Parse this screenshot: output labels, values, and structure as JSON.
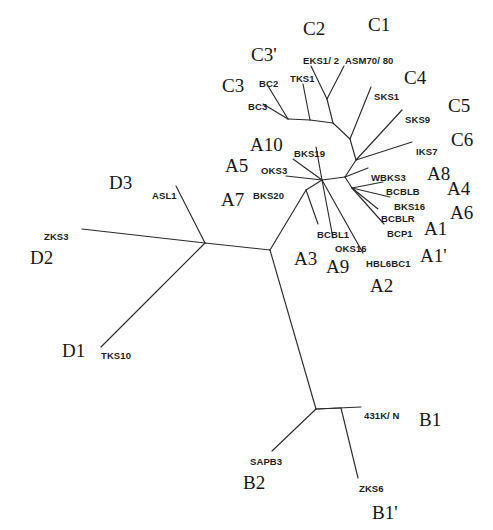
{
  "figure": {
    "kind": "unrooted-phylogenetic-tree",
    "background_color": "#ffffff",
    "line_color": "#2b2b2b",
    "text_color": "#1d1d1d",
    "width": 493,
    "height": 530
  },
  "chart_data": {
    "type": "tree",
    "title": "",
    "leaves": [
      "BC2",
      "BC3",
      "TKS1",
      "EKS1/ 2",
      "ASM70/ 80",
      "SKS1",
      "SKS9",
      "IKS7",
      "BKS19",
      "OKS3",
      "BKS20",
      "WBKS3",
      "BCBLB",
      "BKS16",
      "BCBLR",
      "BCP1",
      "BCBL1",
      "OKS16",
      "HBL6BC1",
      "ASL1",
      "ZKS3",
      "TKS10",
      "431K/ N",
      "SAPB3",
      "ZKS6"
    ],
    "clades": [
      "C1",
      "C2",
      "C3",
      "C3'",
      "C4",
      "C5",
      "C6",
      "A1",
      "A1'",
      "A2",
      "A3",
      "A4",
      "A5",
      "A6",
      "A7",
      "A8",
      "A9",
      "A10",
      "B1",
      "B1'",
      "B2",
      "D1",
      "D2",
      "D3"
    ]
  },
  "leaf_labels": [
    {
      "name": "leaf-bc2",
      "text": "BC2",
      "x": 259,
      "y": 78
    },
    {
      "name": "leaf-bc3",
      "text": "BC3",
      "x": 248,
      "y": 101
    },
    {
      "name": "leaf-tks1",
      "text": "TKS1",
      "x": 290,
      "y": 73
    },
    {
      "name": "leaf-eks12",
      "text": "EKS1/ 2",
      "x": 303,
      "y": 55
    },
    {
      "name": "leaf-asm7080",
      "text": "ASM70/ 80",
      "x": 345,
      "y": 55
    },
    {
      "name": "leaf-sks1",
      "text": "SKS1",
      "x": 374,
      "y": 91
    },
    {
      "name": "leaf-sks9",
      "text": "SKS9",
      "x": 405,
      "y": 114
    },
    {
      "name": "leaf-iks7",
      "text": "IKS7",
      "x": 416,
      "y": 146
    },
    {
      "name": "leaf-bks19",
      "text": "BKS19",
      "x": 294,
      "y": 148
    },
    {
      "name": "leaf-oks3",
      "text": "OKS3",
      "x": 261,
      "y": 165
    },
    {
      "name": "leaf-bks20",
      "text": "BKS20",
      "x": 253,
      "y": 190
    },
    {
      "name": "leaf-wbks3",
      "text": "WBKS3",
      "x": 371,
      "y": 172
    },
    {
      "name": "leaf-bcblb",
      "text": "BCBLB",
      "x": 386,
      "y": 186
    },
    {
      "name": "leaf-bks16",
      "text": "BKS16",
      "x": 394,
      "y": 201
    },
    {
      "name": "leaf-bcblr",
      "text": "BCBLR",
      "x": 381,
      "y": 213
    },
    {
      "name": "leaf-bcp1",
      "text": "BCP1",
      "x": 387,
      "y": 228
    },
    {
      "name": "leaf-bcbl1",
      "text": "BCBL1",
      "x": 317,
      "y": 229
    },
    {
      "name": "leaf-oks16",
      "text": "OKS16",
      "x": 335,
      "y": 243
    },
    {
      "name": "leaf-hbl6bc1",
      "text": "HBL6BC1",
      "x": 366,
      "y": 258
    },
    {
      "name": "leaf-asl1",
      "text": "ASL1",
      "x": 152,
      "y": 190
    },
    {
      "name": "leaf-zks3",
      "text": "ZKS3",
      "x": 44,
      "y": 231
    },
    {
      "name": "leaf-tks10",
      "text": "TKS10",
      "x": 101,
      "y": 350
    },
    {
      "name": "leaf-431kn",
      "text": "431K/ N",
      "x": 364,
      "y": 410
    },
    {
      "name": "leaf-sapb3",
      "text": "SAPB3",
      "x": 250,
      "y": 456
    },
    {
      "name": "leaf-zks6",
      "text": "ZKS6",
      "x": 359,
      "y": 483
    }
  ],
  "group_labels": [
    {
      "name": "clade-c2",
      "text": "C2",
      "x": 303,
      "y": 18
    },
    {
      "name": "clade-c1",
      "text": "C1",
      "x": 368,
      "y": 14
    },
    {
      "name": "clade-c3p",
      "text": "C3'",
      "x": 251,
      "y": 44
    },
    {
      "name": "clade-c3",
      "text": "C3",
      "x": 222,
      "y": 75
    },
    {
      "name": "clade-c4",
      "text": "C4",
      "x": 404,
      "y": 67
    },
    {
      "name": "clade-c5",
      "text": "C5",
      "x": 448,
      "y": 95
    },
    {
      "name": "clade-c6",
      "text": "C6",
      "x": 451,
      "y": 129
    },
    {
      "name": "clade-a10",
      "text": "A10",
      "x": 250,
      "y": 134
    },
    {
      "name": "clade-a5",
      "text": "A5",
      "x": 225,
      "y": 155
    },
    {
      "name": "clade-a7",
      "text": "A7",
      "x": 221,
      "y": 189
    },
    {
      "name": "clade-a8",
      "text": "A8",
      "x": 427,
      "y": 163
    },
    {
      "name": "clade-a4",
      "text": "A4",
      "x": 447,
      "y": 178
    },
    {
      "name": "clade-a6",
      "text": "A6",
      "x": 450,
      "y": 202
    },
    {
      "name": "clade-a1",
      "text": "A1",
      "x": 424,
      "y": 218
    },
    {
      "name": "clade-a1p",
      "text": "A1'",
      "x": 420,
      "y": 245
    },
    {
      "name": "clade-a3",
      "text": "A3",
      "x": 294,
      "y": 248
    },
    {
      "name": "clade-a9",
      "text": "A9",
      "x": 326,
      "y": 256
    },
    {
      "name": "clade-a2",
      "text": "A2",
      "x": 370,
      "y": 275
    },
    {
      "name": "clade-d3",
      "text": "D3",
      "x": 109,
      "y": 172
    },
    {
      "name": "clade-d2",
      "text": "D2",
      "x": 30,
      "y": 247
    },
    {
      "name": "clade-d1",
      "text": "D1",
      "x": 62,
      "y": 340
    },
    {
      "name": "clade-b1",
      "text": "B1",
      "x": 419,
      "y": 409
    },
    {
      "name": "clade-b2",
      "text": "B2",
      "x": 243,
      "y": 472
    },
    {
      "name": "clade-b1p",
      "text": "B1'",
      "x": 372,
      "y": 502
    }
  ],
  "edges": [
    {
      "name": "edge-hub-d",
      "points": "270,250 205,243"
    },
    {
      "name": "edge-d-zks3",
      "points": "205,243 82,229"
    },
    {
      "name": "edge-d-asl1",
      "points": "205,243 176,186"
    },
    {
      "name": "edge-d-tks10",
      "points": "205,243 101,347"
    },
    {
      "name": "edge-hub-b",
      "points": "270,250 316,409"
    },
    {
      "name": "edge-b-431kn",
      "points": "316,409 361,407"
    },
    {
      "name": "edge-b-sapb3",
      "points": "316,409 272,451"
    },
    {
      "name": "edge-b-zks6",
      "points": "341,408 358,478"
    },
    {
      "name": "edge-b-internal",
      "points": "316,409 341,408"
    },
    {
      "name": "edge-hub-a",
      "points": "270,250 306,190"
    },
    {
      "name": "edge-a-n1",
      "points": "306,190 322,180"
    },
    {
      "name": "edge-a-bcbl1",
      "points": "306,190 318,224"
    },
    {
      "name": "edge-a-oks16",
      "points": "322,180 333,238"
    },
    {
      "name": "edge-a-hbl6bc1",
      "points": "322,180 363,253"
    },
    {
      "name": "edge-n1-bks20",
      "points": "322,180 286,176"
    },
    {
      "name": "edge-n1-oks3",
      "points": "322,180 293,159"
    },
    {
      "name": "edge-n1-bks19",
      "points": "322,180 316,147"
    },
    {
      "name": "edge-n1-n2",
      "points": "322,180 345,177"
    },
    {
      "name": "edge-n2-wbks3",
      "points": "345,177 368,168"
    },
    {
      "name": "edge-n2-n3",
      "points": "345,177 352,188"
    },
    {
      "name": "edge-n3-bcblb",
      "points": "352,188 383,182"
    },
    {
      "name": "edge-n3-bks16",
      "points": "352,188 390,197"
    },
    {
      "name": "edge-n3-bcblr",
      "points": "352,188 378,209"
    },
    {
      "name": "edge-n3-bcp1",
      "points": "352,188 384,224"
    },
    {
      "name": "edge-n2-c",
      "points": "345,177 356,160"
    },
    {
      "name": "edge-c-iks7",
      "points": "356,160 412,142"
    },
    {
      "name": "edge-c-sks9",
      "points": "356,160 402,110"
    },
    {
      "name": "edge-c-cnode",
      "points": "356,160 350,139"
    },
    {
      "name": "edge-cnode-sks1",
      "points": "350,139 371,87"
    },
    {
      "name": "edge-cnode-c12",
      "points": "350,139 333,123"
    },
    {
      "name": "edge-c12-node",
      "points": "333,123 327,99"
    },
    {
      "name": "edge-c12-eks",
      "points": "327,99 311,66"
    },
    {
      "name": "edge-c12-asm",
      "points": "327,99 344,66"
    },
    {
      "name": "edge-cnode-c3",
      "points": "333,123 310,120"
    },
    {
      "name": "edge-c3-tks1",
      "points": "310,120 303,84"
    },
    {
      "name": "edge-c3-n",
      "points": "310,120 288,119"
    },
    {
      "name": "edge-c3-bc2",
      "points": "288,119 268,86"
    },
    {
      "name": "edge-c3-bc3",
      "points": "288,119 263,104"
    }
  ]
}
